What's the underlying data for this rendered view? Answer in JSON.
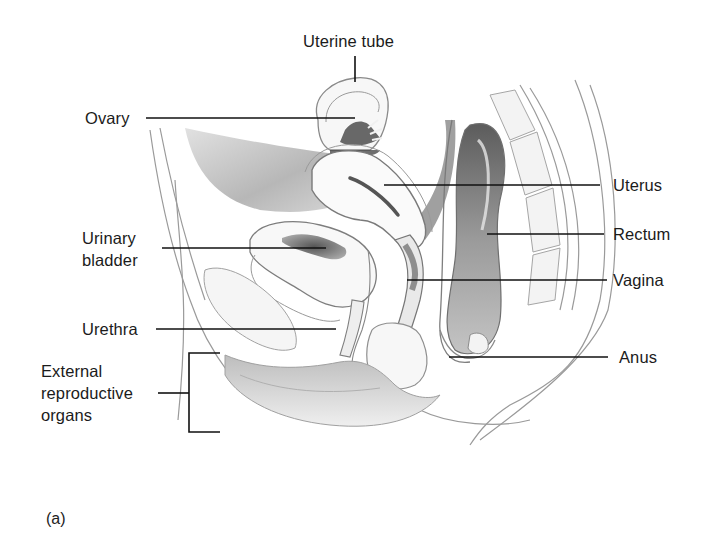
{
  "figure": {
    "panel_label": "(a)",
    "colors": {
      "background": "#ffffff",
      "text": "#1b1b1b",
      "leader_line": "#111111",
      "outline": "#8a8a8a",
      "shade_dark": "#6a6a6a",
      "shade_light": "#d8d8d8"
    },
    "labels": [
      {
        "id": "uterine-tube",
        "text": "Uterine tube"
      },
      {
        "id": "ovary",
        "text": "Ovary"
      },
      {
        "id": "uterus",
        "text": "Uterus"
      },
      {
        "id": "urinary-bladder",
        "lines": [
          "Urinary",
          "bladder"
        ]
      },
      {
        "id": "rectum",
        "text": "Rectum"
      },
      {
        "id": "vagina",
        "text": "Vagina"
      },
      {
        "id": "urethra",
        "text": "Urethra"
      },
      {
        "id": "anus",
        "text": "Anus"
      },
      {
        "id": "external-reproductive-organs",
        "lines": [
          "External",
          "reproductive",
          "organs"
        ]
      }
    ]
  }
}
